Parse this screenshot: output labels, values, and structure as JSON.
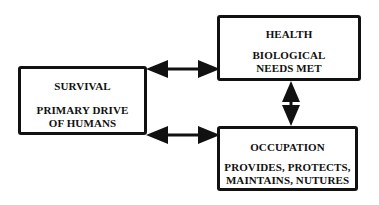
{
  "diagram": {
    "nodes": [
      {
        "id": "survival",
        "title": "SURVIVAL",
        "description": "PRIMARY DRIVE\nOF HUMANS"
      },
      {
        "id": "health",
        "title": "HEALTH",
        "description": "BIOLOGICAL\nNEEDS MET"
      },
      {
        "id": "occupation",
        "title": "OCCUPATION",
        "description": "PROVIDES, PROTECTS,\nMAINTAINS, NUTURES"
      }
    ],
    "edges": [
      {
        "from": "survival",
        "to": "health",
        "type": "bidirectional"
      },
      {
        "from": "survival",
        "to": "occupation",
        "type": "bidirectional"
      },
      {
        "from": "health",
        "to": "occupation",
        "type": "bidirectional"
      }
    ],
    "colors": {
      "stroke": "#111111",
      "background": "#ffffff",
      "text": "#111111"
    }
  }
}
